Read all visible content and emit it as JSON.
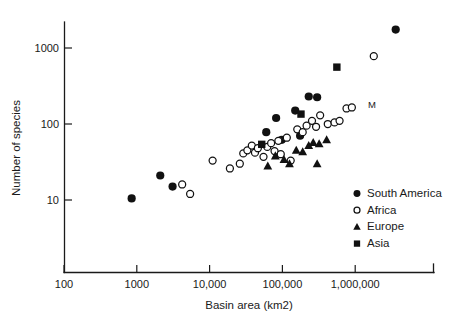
{
  "chart_data": {
    "type": "scatter",
    "title": "",
    "xlabel": "Basin area (km2)",
    "ylabel": "Number of species",
    "xscale": "log",
    "yscale": "log",
    "xlim": [
      100,
      8000000
    ],
    "ylim": [
      4,
      3000
    ],
    "grid": false,
    "xticks": [
      100,
      1000,
      10000,
      100000,
      1000000
    ],
    "xticklabels": [
      "100",
      "1000",
      "10,000",
      "100,000",
      "1,000,000"
    ],
    "yticks": [
      10,
      100,
      1000
    ],
    "yticklabels": [
      "10",
      "100",
      "1000"
    ],
    "legend_position": "lower-right",
    "annotations": [
      {
        "text": "M",
        "x": 1500000,
        "y": 160
      }
    ],
    "series": [
      {
        "name": "South America",
        "marker": "filled-circle",
        "color": "#111111",
        "points": [
          [
            850,
            10.5
          ],
          [
            2100,
            21
          ],
          [
            3100,
            15
          ],
          [
            60000,
            78
          ],
          [
            82000,
            120
          ],
          [
            98000,
            62
          ],
          [
            150000,
            150
          ],
          [
            175000,
            70
          ],
          [
            230000,
            230
          ],
          [
            300000,
            225
          ],
          [
            3600000,
            1750
          ]
        ]
      },
      {
        "name": "Africa",
        "marker": "open-circle",
        "color": "#111111",
        "points": [
          [
            4200,
            16
          ],
          [
            5400,
            12
          ],
          [
            11000,
            33
          ],
          [
            19000,
            26
          ],
          [
            26000,
            30
          ],
          [
            29000,
            41
          ],
          [
            33000,
            45
          ],
          [
            38000,
            52
          ],
          [
            42000,
            42
          ],
          [
            46000,
            48
          ],
          [
            55000,
            37
          ],
          [
            62000,
            50
          ],
          [
            70000,
            56
          ],
          [
            78000,
            44
          ],
          [
            88000,
            60
          ],
          [
            95000,
            40
          ],
          [
            115000,
            66
          ],
          [
            130000,
            33
          ],
          [
            160000,
            85
          ],
          [
            190000,
            78
          ],
          [
            215000,
            95
          ],
          [
            255000,
            110
          ],
          [
            290000,
            92
          ],
          [
            330000,
            130
          ],
          [
            420000,
            100
          ],
          [
            520000,
            105
          ],
          [
            610000,
            110
          ],
          [
            760000,
            160
          ],
          [
            900000,
            165
          ],
          [
            1800000,
            780
          ]
        ]
      },
      {
        "name": "Europe",
        "marker": "filled-triangle",
        "color": "#111111",
        "points": [
          [
            63000,
            28
          ],
          [
            80000,
            38
          ],
          [
            105000,
            34
          ],
          [
            125000,
            30
          ],
          [
            155000,
            45
          ],
          [
            190000,
            43
          ],
          [
            230000,
            52
          ],
          [
            265000,
            57
          ],
          [
            300000,
            30
          ],
          [
            320000,
            55
          ],
          [
            405000,
            62
          ]
        ]
      },
      {
        "name": "Asia",
        "marker": "filled-square",
        "color": "#111111",
        "points": [
          [
            52000,
            54
          ],
          [
            180000,
            135
          ],
          [
            560000,
            560
          ]
        ]
      }
    ]
  },
  "legend": {
    "items": [
      {
        "label": "South America",
        "marker": "filled-circle"
      },
      {
        "label": "Africa",
        "marker": "open-circle"
      },
      {
        "label": "Europe",
        "marker": "filled-triangle"
      },
      {
        "label": "Asia",
        "marker": "filled-square"
      }
    ]
  }
}
